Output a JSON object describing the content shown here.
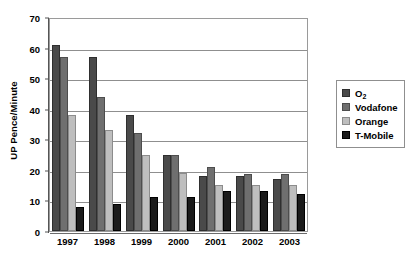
{
  "chart_data": {
    "type": "bar",
    "title": "",
    "subtitle": "",
    "xlabel": "",
    "ylabel": "UP Pence/Minute",
    "ylim": [
      0,
      70
    ],
    "ytick_step": 10,
    "yticks": [
      0,
      10,
      20,
      30,
      40,
      50,
      60,
      70
    ],
    "ytick_labels": [
      "0",
      "10",
      "20",
      "30",
      "40",
      "50",
      "60",
      "70"
    ],
    "categories": [
      "1997",
      "1998",
      "1999",
      "2000",
      "2001",
      "2002",
      "2003"
    ],
    "grid": "horizontal",
    "legend_position": "right",
    "series": [
      {
        "name": "O2",
        "display_name_main": "O",
        "display_name_sub": "2",
        "color": "#4a4a4a",
        "values": [
          61,
          57,
          38,
          25,
          18,
          18,
          17
        ]
      },
      {
        "name": "Vodafone",
        "display_name_main": "Vodafone",
        "display_name_sub": "",
        "color": "#6f6f6f",
        "values": [
          57,
          44,
          32,
          25,
          21,
          18.5,
          18.5
        ]
      },
      {
        "name": "Orange",
        "display_name_main": "Orange",
        "display_name_sub": "",
        "color": "#bebebe",
        "values": [
          38,
          33,
          25,
          19,
          15,
          15,
          15
        ]
      },
      {
        "name": "T-Mobile",
        "display_name_main": "T-Mobile",
        "display_name_sub": "",
        "color": "#1b1b1b",
        "values": [
          8,
          9,
          11,
          11,
          13,
          13,
          12
        ]
      }
    ]
  }
}
